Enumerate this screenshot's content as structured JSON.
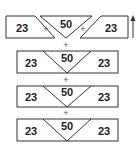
{
  "top_row": {
    "left": "23",
    "middle": "50",
    "right": "23",
    "plus": "+"
  },
  "rows": [
    {
      "left": "23",
      "middle": "50",
      "right": "23"
    },
    {
      "left": "23",
      "middle": "50",
      "right": "23"
    },
    {
      "left": "23",
      "middle": "50",
      "right": "23"
    }
  ],
  "connector": "+",
  "colors": {
    "stroke": "#333333",
    "text": "#222222"
  }
}
